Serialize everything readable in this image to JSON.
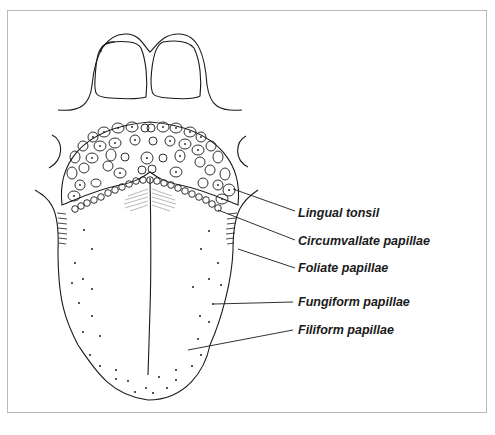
{
  "diagram": {
    "labels": [
      {
        "id": "lingual-tonsil",
        "text": "Lingual tonsil"
      },
      {
        "id": "circumvallate-papillae",
        "text": "Circumvallate papillae"
      },
      {
        "id": "foliate-papillae",
        "text": "Foliate papillae"
      },
      {
        "id": "fungiform-papillae",
        "text": "Fungiform papillae"
      },
      {
        "id": "filiform-papillae",
        "text": "Filiform papillae"
      }
    ],
    "colors": {
      "line": "#1a1a1a",
      "frame": "#b9b9b9",
      "background": "#ffffff"
    }
  }
}
